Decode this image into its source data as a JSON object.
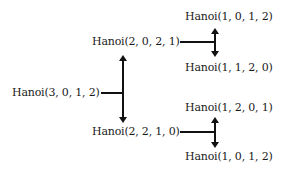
{
  "diagram": {
    "type": "recursion-tree",
    "root": {
      "label": "Hanoi(3, 0, 1, 2)",
      "children": [
        {
          "label": "Hanoi(2, 0, 2, 1)",
          "children": [
            {
              "label": "Hanoi(1, 0, 1, 2)"
            },
            {
              "label": "Hanoi(1, 1, 2, 0)"
            }
          ]
        },
        {
          "label": "Hanoi(2, 2, 1, 0)",
          "children": [
            {
              "label": "Hanoi(1, 2, 0, 1)"
            },
            {
              "label": "Hanoi(1, 0, 1, 2)"
            }
          ]
        }
      ]
    },
    "colors": {
      "line": "#111111",
      "text": "#1a1a1a",
      "background": "#ffffff"
    }
  }
}
